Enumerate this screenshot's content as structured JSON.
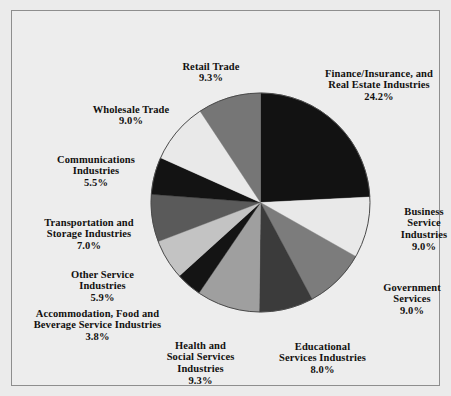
{
  "figure": {
    "background_color": "#ebebeb",
    "frame_color": "#8e8e8e",
    "pie_outline_color": "#4a4a4a"
  },
  "chart_data": {
    "type": "pie",
    "title": "",
    "subtitle": "",
    "xlabel": "",
    "ylabel": "",
    "legend_position": "none",
    "grid": false,
    "start_angle_deg": 0,
    "direction": "clockwise",
    "units": "percent",
    "total": 100.0,
    "categories": [
      "Finance/Insurance, and Real Estate Industries",
      "Business Service Industries",
      "Government Services",
      "Educational Services Industries",
      "Health and Social Services Industries",
      "Accommodation, Food and Beverage Service Industries",
      "Other Service Industries",
      "Transportation and Storage Industries",
      "Communications Industries",
      "Wholesale Trade",
      "Retail Trade"
    ],
    "values": [
      24.2,
      9.0,
      9.0,
      8.0,
      9.3,
      3.8,
      5.9,
      7.0,
      5.5,
      9.0,
      9.3
    ],
    "colors": [
      "#121212",
      "#e9e9e9",
      "#7c7c7c",
      "#3b3b3b",
      "#9f9f9f",
      "#141414",
      "#c3c3c3",
      "#5a5a5a",
      "#131313",
      "#e9e9e9",
      "#767676"
    ],
    "slices": [
      {
        "name": "Finance/Insurance, and Real Estate Industries",
        "label_lines": [
          "Finance/Insurance, and",
          "Real Estate Industries"
        ],
        "value": 24.2,
        "value_label": "24.2%",
        "color": "#121212"
      },
      {
        "name": "Business Service Industries",
        "label_lines": [
          "Business",
          "Service",
          "Industries"
        ],
        "value": 9.0,
        "value_label": "9.0%",
        "color": "#e9e9e9"
      },
      {
        "name": "Government Services",
        "label_lines": [
          "Government",
          "Services"
        ],
        "value": 9.0,
        "value_label": "9.0%",
        "color": "#7c7c7c"
      },
      {
        "name": "Educational Services Industries",
        "label_lines": [
          "Educational",
          "Services Industries"
        ],
        "value": 8.0,
        "value_label": "8.0%",
        "color": "#3b3b3b"
      },
      {
        "name": "Health and Social Services Industries",
        "label_lines": [
          "Health and",
          "Social Services",
          "Industries"
        ],
        "value": 9.3,
        "value_label": "9.3%",
        "color": "#9f9f9f"
      },
      {
        "name": "Accommodation, Food and Beverage Service Industries",
        "label_lines": [
          "Accommodation, Food and",
          "Beverage Service Industries"
        ],
        "value": 3.8,
        "value_label": "3.8%",
        "color": "#141414"
      },
      {
        "name": "Other Service Industries",
        "label_lines": [
          "Other Service",
          "Industries"
        ],
        "value": 5.9,
        "value_label": "5.9%",
        "color": "#c3c3c3"
      },
      {
        "name": "Transportation and Storage Industries",
        "label_lines": [
          "Transportation and",
          "Storage Industries"
        ],
        "value": 7.0,
        "value_label": "7.0%",
        "color": "#5a5a5a"
      },
      {
        "name": "Communications Industries",
        "label_lines": [
          "Communications",
          "Industries"
        ],
        "value": 5.5,
        "value_label": "5.5%",
        "color": "#131313"
      },
      {
        "name": "Wholesale Trade",
        "label_lines": [
          "Wholesale Trade"
        ],
        "value": 9.0,
        "value_label": "9.0%",
        "color": "#e9e9e9"
      },
      {
        "name": "Retail Trade",
        "label_lines": [
          "Retail Trade"
        ],
        "value": 9.3,
        "value_label": "9.3%",
        "color": "#767676"
      }
    ]
  },
  "labels": {
    "finance": {
      "text": "Finance/Insurance, and\nReal Estate Industries",
      "pct": "24.2%"
    },
    "business": {
      "text": "Business\nService\nIndustries",
      "pct": "9.0%"
    },
    "government": {
      "text": "Government\nServices",
      "pct": "9.0%"
    },
    "education": {
      "text": "Educational\nServices Industries",
      "pct": "8.0%"
    },
    "health": {
      "text": "Health and\nSocial Services\nIndustries",
      "pct": "9.3%"
    },
    "accommodation": {
      "text": "Accommodation, Food and\nBeverage Service Industries",
      "pct": "3.8%"
    },
    "otherservice": {
      "text": "Other Service\nIndustries",
      "pct": "5.9%"
    },
    "transport": {
      "text": "Transportation and\nStorage Industries",
      "pct": "7.0%"
    },
    "communications": {
      "text": "Communications\nIndustries",
      "pct": "5.5%"
    },
    "wholesale": {
      "text": "Wholesale Trade",
      "pct": "9.0%"
    },
    "retail": {
      "text": "Retail Trade",
      "pct": "9.3%"
    }
  }
}
